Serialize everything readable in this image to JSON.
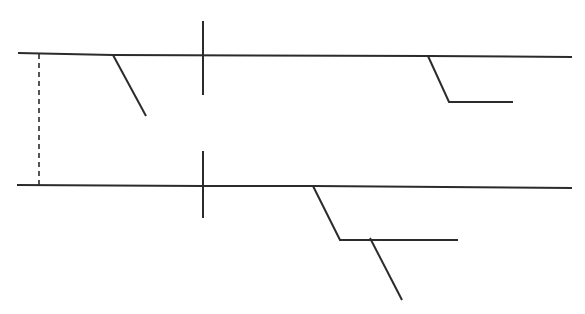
{
  "canvas": {
    "width": 585,
    "height": 314,
    "background": "#ffffff",
    "stroke_color": "#2b2b2b"
  },
  "figure": {
    "type": "line-drawing",
    "elements": [
      {
        "name": "upper-bed-line-left",
        "kind": "polyline",
        "stroke_width": 2.0,
        "points": [
          [
            18,
            53
          ],
          [
            113,
            55
          ],
          [
            428,
            56
          ]
        ]
      },
      {
        "name": "upper-fault-diagonal-left",
        "kind": "polyline",
        "stroke_width": 2.0,
        "points": [
          [
            113,
            55
          ],
          [
            146,
            116
          ]
        ]
      },
      {
        "name": "upper-bed-line-right",
        "kind": "polyline",
        "stroke_width": 2.0,
        "points": [
          [
            428,
            56
          ],
          [
            572,
            57
          ]
        ]
      },
      {
        "name": "upper-fault-step-right",
        "kind": "polyline",
        "stroke_width": 2.0,
        "points": [
          [
            428,
            56
          ],
          [
            449,
            102
          ],
          [
            513,
            102
          ]
        ]
      },
      {
        "name": "upper-tick-vertical",
        "kind": "polyline",
        "stroke_width": 2.0,
        "points": [
          [
            203,
            21
          ],
          [
            203,
            95
          ]
        ]
      },
      {
        "name": "lower-bed-line-left",
        "kind": "polyline",
        "stroke_width": 2.0,
        "points": [
          [
            17,
            185
          ],
          [
            203,
            186
          ],
          [
            313,
            186
          ]
        ]
      },
      {
        "name": "lower-bed-line-right",
        "kind": "polyline",
        "stroke_width": 2.0,
        "points": [
          [
            313,
            186
          ],
          [
            572,
            188
          ]
        ]
      },
      {
        "name": "lower-fault-step",
        "kind": "polyline",
        "stroke_width": 2.0,
        "points": [
          [
            313,
            186
          ],
          [
            340,
            240
          ],
          [
            458,
            240
          ]
        ]
      },
      {
        "name": "lower-fault-diagonal",
        "kind": "polyline",
        "stroke_width": 2.0,
        "points": [
          [
            370,
            238
          ],
          [
            402,
            300
          ]
        ]
      },
      {
        "name": "lower-tick-vertical",
        "kind": "polyline",
        "stroke_width": 2.0,
        "points": [
          [
            203,
            151
          ],
          [
            203,
            218
          ]
        ]
      },
      {
        "name": "correlation-dashed-line",
        "kind": "polyline",
        "stroke_width": 1.6,
        "dash": "5,4",
        "points": [
          [
            39,
            54
          ],
          [
            39,
            186
          ]
        ]
      }
    ]
  }
}
